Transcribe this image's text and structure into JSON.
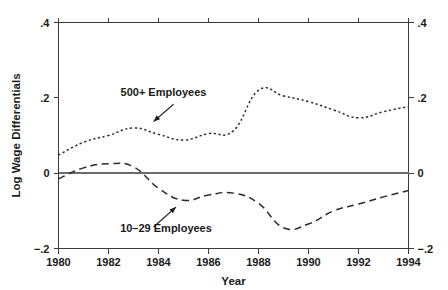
{
  "chart_data": {
    "type": "line",
    "title": "",
    "xlabel": "Year",
    "ylabel": "Log Wage Differentials",
    "xlim": [
      1980,
      1994
    ],
    "ylim": [
      -0.2,
      0.4
    ],
    "xticks": [
      1980,
      1982,
      1984,
      1986,
      1988,
      1990,
      1992,
      1994
    ],
    "xtick_labels": [
      "1980",
      "1982",
      "1984",
      "1986",
      "1988",
      "1990",
      "1992",
      "1994"
    ],
    "yticks": [
      -0.2,
      0,
      0.2,
      0.4
    ],
    "ytick_labels": [
      "−.2",
      "0",
      ".2",
      ".4"
    ],
    "grid": false,
    "legend": "annotations-with-arrows",
    "reference_line": {
      "y": 0,
      "style": "solid",
      "color": "#6b6b6b"
    },
    "x": [
      1980,
      1981,
      1982,
      1983,
      1984,
      1985,
      1986,
      1987,
      1988,
      1989,
      1990,
      1991,
      1992,
      1993,
      1994
    ],
    "series": [
      {
        "name": "500+ Employees",
        "style": "dotted",
        "color": "#2a2a2a",
        "values": [
          0.048,
          0.082,
          0.1,
          0.12,
          0.103,
          0.088,
          0.105,
          0.113,
          0.22,
          0.205,
          0.19,
          0.168,
          0.147,
          0.163,
          0.177
        ]
      },
      {
        "name": "10–29 Employees",
        "style": "dashed",
        "color": "#2a2a2a",
        "values": [
          -0.015,
          0.014,
          0.025,
          0.017,
          -0.04,
          -0.072,
          -0.058,
          -0.053,
          -0.08,
          -0.145,
          -0.135,
          -0.1,
          -0.082,
          -0.063,
          -0.046
        ]
      }
    ],
    "annotations": [
      {
        "name": "500+ Employees",
        "text": "500+  Employees",
        "text_x": 1984.2,
        "text_y": 0.205,
        "arrow_from_x": 1984.6,
        "arrow_from_y": 0.183,
        "arrow_to_x": 1983.8,
        "arrow_to_y": 0.137
      },
      {
        "name": "10–29 Employees",
        "text": "10–29 Employees",
        "text_x": 1984.3,
        "text_y": -0.156,
        "arrow_from_x": 1983.8,
        "arrow_from_y": -0.143,
        "arrow_to_x": 1984.7,
        "arrow_to_y": -0.09
      }
    ]
  }
}
